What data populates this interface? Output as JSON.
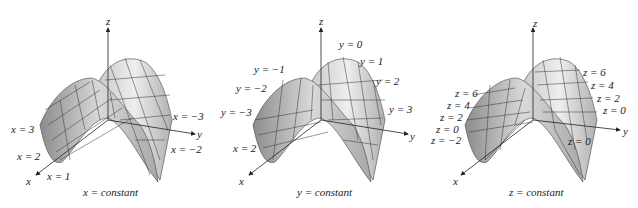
{
  "figure": {
    "panels": [
      {
        "caption": "x = constant",
        "axes": {
          "x": "x",
          "y": "y",
          "z": "z"
        },
        "labels": [
          "x = 3",
          "x = 2",
          "x = 1",
          "x = −3",
          "x = −2"
        ]
      },
      {
        "caption": "y = constant",
        "axes": {
          "x": "x",
          "y": "y",
          "z": "z"
        },
        "labels": [
          "y = 0",
          "y = 1",
          "y = −1",
          "y = 2",
          "y = −2",
          "y = 3",
          "y = −3",
          "x = 2"
        ]
      },
      {
        "caption": "z = constant",
        "axes": {
          "x": "x",
          "y": "y",
          "z": "z"
        },
        "labels": [
          "z = 6",
          "z = 4",
          "z = 2",
          "z = 0",
          "z = −2",
          "z = 6",
          "z = 4",
          "z = 2",
          "z = 0",
          "z = 0"
        ]
      }
    ],
    "colors": {
      "surface_light": "#e8e8e8",
      "surface_dark": "#9a9a9a",
      "mesh": "#333333",
      "axis": "#222222"
    }
  }
}
